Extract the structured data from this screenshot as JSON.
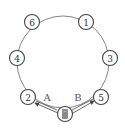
{
  "diagram": {
    "type": "circular-node-graph",
    "colors": {
      "stroke": "#444444",
      "ring": "#777777",
      "start_fill": "#8a8a8a",
      "background": "#ffffff"
    },
    "nodes": [
      {
        "id": "6",
        "label": "6"
      },
      {
        "id": "1",
        "label": "1"
      },
      {
        "id": "4",
        "label": "4"
      },
      {
        "id": "3",
        "label": "3"
      },
      {
        "id": "2",
        "label": "2"
      },
      {
        "id": "5",
        "label": "5"
      },
      {
        "id": "start",
        "label": "",
        "symbol": "filled-gray-rectangle"
      }
    ],
    "edges": [
      {
        "from": "start",
        "to": "2",
        "label": "A",
        "style": "double-arrow"
      },
      {
        "from": "start",
        "to": "5",
        "label": "B",
        "style": "double-arrow"
      }
    ],
    "ring": {
      "connects": [
        "6",
        "1",
        "3",
        "5",
        "2",
        "4"
      ]
    }
  }
}
